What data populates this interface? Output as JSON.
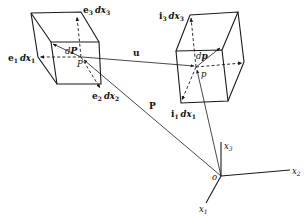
{
  "figure": {
    "type": "vector-diagram"
  },
  "left_element": {
    "point_label": "P",
    "differential_label": "dP",
    "edge_labels": {
      "e1": {
        "vector": "e",
        "sub": "1",
        "diff": "dx",
        "diff_sub": "1"
      },
      "e2": {
        "vector": "e",
        "sub": "2",
        "diff": "dx",
        "diff_sub": "2"
      },
      "e3": {
        "vector": "e",
        "sub": "3",
        "diff": "dx",
        "diff_sub": "3"
      }
    }
  },
  "right_element": {
    "point_label": "p",
    "differential_label": "dp",
    "edge_labels": {
      "i1": {
        "vector": "i",
        "sub": "1",
        "diff": "dx",
        "diff_sub": "1"
      },
      "i3": {
        "vector": "i",
        "sub": "3",
        "diff": "dx",
        "diff_sub": "3"
      }
    }
  },
  "vectors": {
    "displacement": "u",
    "position": "P"
  },
  "axes": {
    "origin": "o",
    "x1": {
      "base": "x",
      "sub": "1"
    },
    "x2": {
      "base": "x",
      "sub": "2"
    },
    "x3": {
      "base": "x",
      "sub": "3"
    }
  },
  "colors": {
    "ink": "#1a1a1a",
    "background": "#ffffff"
  }
}
